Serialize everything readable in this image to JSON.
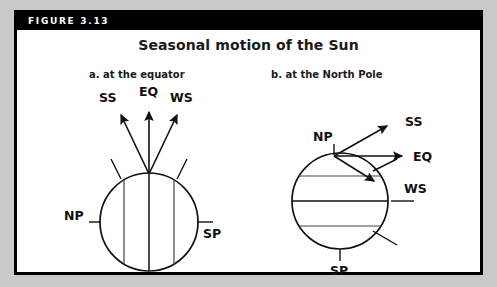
{
  "figure": {
    "header_label": "FIGURE 3.13",
    "title": "Seasonal motion of the Sun",
    "header_background": "#000000",
    "header_text_color": "#ffffff",
    "frame_border_color": "#000000",
    "canvas_color": "#ffffff",
    "page_background": "#c9c9c9",
    "ink_color": "#111111"
  },
  "panels": [
    {
      "id": "a",
      "caption": "a. at the equator",
      "globe": {
        "center_x": 146,
        "center_y": 219,
        "radius": 49,
        "grid_orientation": "vertical",
        "grid_line_count": 3
      },
      "pole_labels": [
        {
          "name": "NP",
          "text": "NP",
          "position": "left"
        },
        {
          "name": "SP",
          "text": "SP",
          "position": "right"
        }
      ],
      "arrows": [
        {
          "name": "SS",
          "text": "SS",
          "direction": "up-left"
        },
        {
          "name": "EQ",
          "text": "EQ",
          "direction": "up"
        },
        {
          "name": "WS",
          "text": "WS",
          "direction": "up-right"
        }
      ]
    },
    {
      "id": "b",
      "caption": "b. at the North Pole",
      "globe": {
        "center_x": 337,
        "center_y": 198,
        "radius": 48,
        "grid_orientation": "horizontal",
        "grid_line_count": 3
      },
      "pole_labels": [
        {
          "name": "NP",
          "text": "NP",
          "position": "top"
        },
        {
          "name": "SP",
          "text": "SP",
          "position": "bottom"
        }
      ],
      "arrows": [
        {
          "name": "SS",
          "text": "SS",
          "direction": "up-right"
        },
        {
          "name": "EQ",
          "text": "EQ",
          "direction": "right"
        },
        {
          "name": "WS",
          "text": "WS",
          "direction": "down-right"
        }
      ]
    }
  ]
}
